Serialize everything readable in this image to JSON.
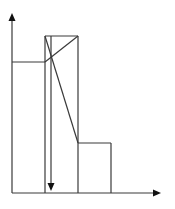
{
  "diagram": {
    "type": "step-profile-with-diagonals",
    "colors": {
      "line": "#3a3a3a",
      "arrow": "#111111",
      "background": "#ffffff"
    },
    "axes": {
      "origin": [
        12,
        193
      ],
      "y_axis_top": [
        12,
        14
      ],
      "x_axis_right": [
        160,
        193
      ]
    },
    "segments": [
      {
        "name": "left-step-top",
        "from": [
          12,
          62
        ],
        "to": [
          45,
          62
        ]
      },
      {
        "name": "left-step-rise",
        "from": [
          45,
          193
        ],
        "to": [
          45,
          36
        ]
      },
      {
        "name": "tall-block-top",
        "from": [
          45,
          36
        ],
        "to": [
          78,
          36
        ]
      },
      {
        "name": "tall-block-right",
        "from": [
          78,
          36
        ],
        "to": [
          78,
          193
        ]
      },
      {
        "name": "diagonal-down",
        "from": [
          45,
          36
        ],
        "to": [
          78,
          143
        ]
      },
      {
        "name": "diagonal-up",
        "from": [
          45,
          62
        ],
        "to": [
          78,
          36
        ]
      },
      {
        "name": "right-step-top",
        "from": [
          78,
          143
        ],
        "to": [
          111,
          143
        ]
      },
      {
        "name": "right-step-drop",
        "from": [
          111,
          143
        ],
        "to": [
          111,
          193
        ]
      }
    ],
    "inner_arrow": {
      "from": [
        51,
        36
      ],
      "to": [
        51,
        191
      ],
      "direction": "down"
    }
  }
}
